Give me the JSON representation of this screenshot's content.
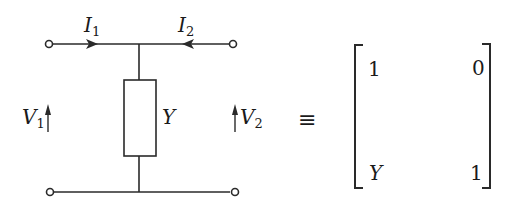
{
  "diagram": {
    "circuit": {
      "current_labels": [
        {
          "symbol": "I",
          "subscript": "1"
        },
        {
          "symbol": "I",
          "subscript": "2"
        }
      ],
      "voltage_labels": [
        {
          "symbol": "V",
          "subscript": "1"
        },
        {
          "symbol": "V",
          "subscript": "2"
        }
      ],
      "element_label": "Y"
    },
    "equivalence_symbol": "≡",
    "matrix": {
      "rows": [
        [
          "1",
          "0"
        ],
        [
          "Y",
          "1"
        ]
      ]
    },
    "colors": {
      "line": "#2a2a2a",
      "background": "#ffffff"
    }
  }
}
